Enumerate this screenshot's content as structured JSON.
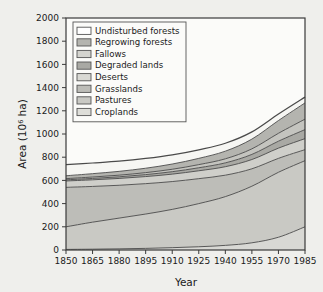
{
  "chart_data": {
    "type": "area",
    "stacked": true,
    "title": "",
    "subtitle": "",
    "xlabel": "Year",
    "ylabel": "Area (10⁶ ha)",
    "ylabel_base": "Area (10",
    "ylabel_exp": "6",
    "ylabel_tail": " ha)",
    "xlim": [
      1850,
      1985
    ],
    "ylim": [
      0,
      2000
    ],
    "grid": false,
    "legend_position": "upper-left-inside",
    "x": [
      1850,
      1865,
      1880,
      1895,
      1910,
      1925,
      1940,
      1955,
      1970,
      1985
    ],
    "xticks": [
      "1850",
      "1865",
      "1880",
      "1895",
      "1910",
      "1925",
      "1940",
      "1955",
      "1970",
      "1985"
    ],
    "yticks": [
      "0",
      "200",
      "400",
      "600",
      "800",
      "1000",
      "1200",
      "1400",
      "1600",
      "1800",
      "2000"
    ],
    "series": [
      {
        "name": "Croplands",
        "color": "#d8d8d4",
        "values": [
          5,
          7,
          10,
          14,
          20,
          28,
          40,
          62,
          110,
          200
        ]
      },
      {
        "name": "Pastures",
        "color": "#c9c9c4",
        "values": [
          195,
          233,
          265,
          296,
          330,
          372,
          420,
          488,
          560,
          570
        ]
      },
      {
        "name": "Grasslands",
        "color": "#bdbdb8",
        "values": [
          340,
          308,
          283,
          262,
          240,
          215,
          185,
          150,
          120,
          95
        ]
      },
      {
        "name": "Deserts",
        "color": "#cfcfca",
        "values": [
          55,
          57,
          59,
          61,
          64,
          68,
          73,
          80,
          88,
          95
        ]
      },
      {
        "name": "Degraded lands",
        "color": "#a9a9a4",
        "values": [
          10,
          12,
          14,
          17,
          21,
          26,
          33,
          44,
          60,
          78
        ]
      },
      {
        "name": "Fallows",
        "color": "#c4c4bf",
        "values": [
          10,
          12,
          14,
          17,
          21,
          27,
          35,
          48,
          68,
          90
        ]
      },
      {
        "name": "Regrowing forests",
        "color": "#b4b4af",
        "values": [
          25,
          29,
          33,
          38,
          45,
          54,
          66,
          84,
          110,
          140
        ]
      },
      {
        "name": "Undisturbed forests",
        "color": "#f6f6f3",
        "values": [
          95,
          92,
          88,
          84,
          79,
          74,
          68,
          62,
          56,
          50
        ]
      }
    ],
    "legend_entries": [
      {
        "label": "Undisturbed forests",
        "color": "#ffffff"
      },
      {
        "label": "Regrowing forests",
        "color": "#b4b4af"
      },
      {
        "label": "Fallows",
        "color": "#d4d4cf"
      },
      {
        "label": "Degraded lands",
        "color": "#a9a9a4"
      },
      {
        "label": "Deserts",
        "color": "#d9d9d4"
      },
      {
        "label": "Grasslands",
        "color": "#bdbdb8"
      },
      {
        "label": "Pastures",
        "color": "#c9c9c4"
      },
      {
        "label": "Croplands",
        "color": "#dedeD9"
      }
    ]
  }
}
